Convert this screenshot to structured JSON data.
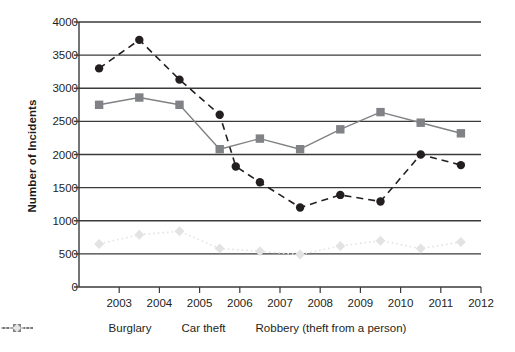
{
  "chart_data": {
    "type": "line",
    "title": "",
    "xlabel": "",
    "ylabel": "Number of Incidents",
    "ylim": [
      0,
      4000
    ],
    "ytick_values": [
      0,
      500,
      1000,
      1500,
      2000,
      2500,
      3000,
      3500,
      4000
    ],
    "ytick_labels": [
      "0",
      "500",
      "1000",
      "1500",
      "2000",
      "2500",
      "3000",
      "3500",
      "4000"
    ],
    "xlim": [
      2002,
      2012
    ],
    "xtick_values": [
      2003,
      2004,
      2005,
      2006,
      2007,
      2008,
      2009,
      2010,
      2011,
      2012
    ],
    "xtick_labels": [
      "2003",
      "2004",
      "2005",
      "2006",
      "2007",
      "2008",
      "2009",
      "2010",
      "2011",
      "2012"
    ],
    "grid": "horizontal",
    "legend_position": "bottom",
    "x": [
      2002.5,
      2003.0,
      2003.5,
      2004.0,
      2004.5,
      2005.0,
      2005.5,
      2006.0,
      2006.5,
      2007.0,
      2007.5,
      2008.0,
      2008.5,
      2009.0,
      2009.5,
      2010.0,
      2010.5,
      2011.0,
      2011.5
    ],
    "series": [
      {
        "name": "Burglary",
        "color": "#231f20",
        "marker": "circle",
        "linestyle": "dashed",
        "x": [
          2002.5,
          2003.5,
          2004.5,
          2005.5,
          2005.9,
          2006.5,
          2007.5,
          2008.5,
          2009.5,
          2010.5,
          2011.5
        ],
        "values": [
          3300,
          3730,
          3130,
          2600,
          1820,
          1580,
          1200,
          1390,
          1290,
          2000,
          1840
        ]
      },
      {
        "name": "Car theft",
        "color": "#808285",
        "marker": "square",
        "linestyle": "solid",
        "x": [
          2002.5,
          2003.5,
          2004.5,
          2005.5,
          2006.5,
          2007.5,
          2008.5,
          2009.5,
          2010.5,
          2011.5
        ],
        "values": [
          2750,
          2860,
          2750,
          2080,
          2240,
          2080,
          2380,
          2640,
          2480,
          2320
        ]
      },
      {
        "name": "Robbery (theft from a person)",
        "color": "#e3e3e4",
        "marker": "diamond",
        "linestyle": "dotted",
        "x": [
          2002.5,
          2003.5,
          2004.5,
          2005.5,
          2006.5,
          2007.5,
          2008.5,
          2009.5,
          2010.5,
          2011.5
        ],
        "values": [
          650,
          790,
          840,
          580,
          540,
          490,
          620,
          700,
          580,
          680
        ]
      }
    ]
  },
  "legend": {
    "items": [
      {
        "label": "Burglary"
      },
      {
        "label": "Car theft"
      },
      {
        "label": "Robbery (theft from a person)"
      }
    ]
  }
}
